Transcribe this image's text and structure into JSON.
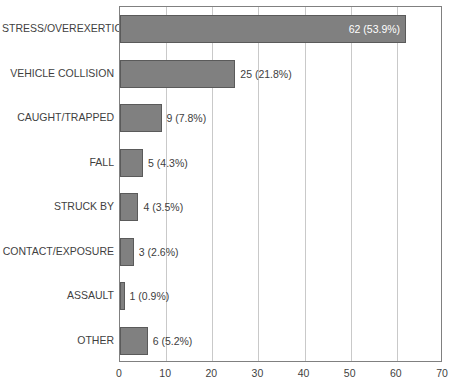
{
  "chart_data": {
    "type": "bar",
    "orientation": "horizontal",
    "title": "",
    "subtitle": "",
    "xlabel": "",
    "ylabel": "",
    "xlim": [
      0,
      70
    ],
    "xticks": [
      0,
      10,
      20,
      30,
      40,
      50,
      60,
      70
    ],
    "xtick_labels": [
      "0",
      "10",
      "20",
      "30",
      "40",
      "50",
      "60",
      "70"
    ],
    "grid": "vertical",
    "legend": "none",
    "categories": [
      "STRESS/OVEREXERTION",
      "VEHICLE COLLISION",
      "CAUGHT/TRAPPED",
      "FALL",
      "STRUCK BY",
      "CONTACT/EXPOSURE",
      "ASSAULT",
      "OTHER"
    ],
    "values": [
      62,
      25,
      9,
      5,
      4,
      3,
      1,
      6
    ],
    "percents": [
      53.9,
      21.8,
      7.8,
      4.3,
      3.5,
      2.6,
      0.9,
      5.2
    ],
    "data_labels": [
      "62 (53.9%)",
      "25 (21.8%)",
      "9 (7.8%)",
      "5 (4.3%)",
      "4 (3.5%)",
      "3 (2.6%)",
      "1 (0.9%)",
      "6 (5.2%)"
    ],
    "label_placement": [
      "inside",
      "outside",
      "outside",
      "outside",
      "outside",
      "outside",
      "outside",
      "outside"
    ],
    "colors": {
      "bar_fill": "#808080",
      "bar_edge": "#5a5a5a",
      "gridline": "#c9c9c9",
      "axis": "#808080",
      "label_text": "#3f3f3f",
      "inside_label_text": "#ffffff",
      "background": "#ffffff"
    }
  }
}
